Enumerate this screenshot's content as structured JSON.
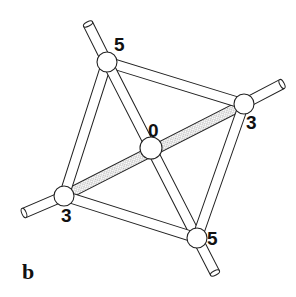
{
  "figure": {
    "panel_label": "b",
    "colors": {
      "stroke": "#222222",
      "fill": "#ffffff",
      "hatch": "#9a9a9a"
    }
  },
  "nodes": [
    {
      "id": "top",
      "label": "5",
      "x": 107,
      "y": 62,
      "label_x": 114,
      "label_y": 51
    },
    {
      "id": "right",
      "label": "3",
      "x": 244,
      "y": 104,
      "label_x": 246,
      "label_y": 129
    },
    {
      "id": "center",
      "label": "0",
      "x": 151,
      "y": 148,
      "label_x": 148,
      "label_y": 137
    },
    {
      "id": "left",
      "label": "3",
      "x": 64,
      "y": 196,
      "label_x": 61,
      "label_y": 222
    },
    {
      "id": "bottom",
      "label": "5",
      "x": 197,
      "y": 238,
      "label_x": 207,
      "label_y": 245
    }
  ],
  "bonds": [
    {
      "from": "top",
      "to": "right",
      "style": "plain"
    },
    {
      "from": "top",
      "to": "left",
      "style": "plain"
    },
    {
      "from": "top",
      "to": "bottom",
      "style": "plain"
    },
    {
      "from": "right",
      "to": "bottom",
      "style": "plain"
    },
    {
      "from": "left",
      "to": "bottom",
      "style": "plain"
    },
    {
      "from": "left",
      "to": "right",
      "style": "hatched"
    }
  ],
  "stubs": [
    {
      "node": "top",
      "x": 88,
      "y": 24
    },
    {
      "node": "right",
      "x": 282,
      "y": 84
    },
    {
      "node": "left",
      "x": 24,
      "y": 213
    },
    {
      "node": "bottom",
      "x": 215,
      "y": 273
    }
  ]
}
